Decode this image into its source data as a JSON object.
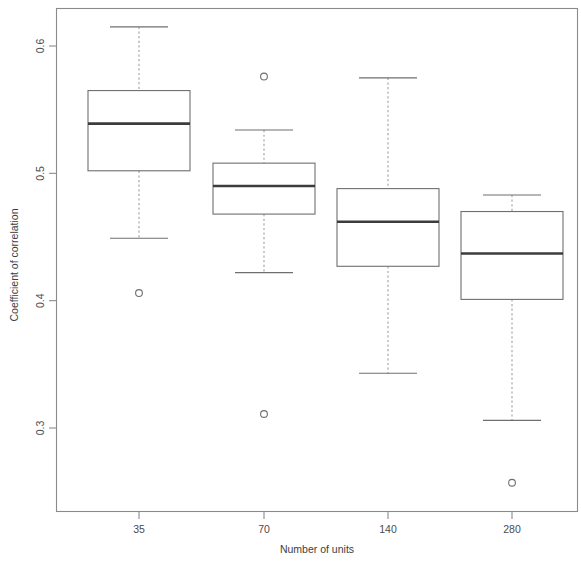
{
  "chart_data": {
    "type": "box",
    "title": "",
    "xlabel": "Number of units",
    "ylabel": "Coefficient of correlation",
    "categories": [
      "35",
      "70",
      "140",
      "280"
    ],
    "x_tick_labels": [
      "35",
      "70",
      "140",
      "280"
    ],
    "y_tick_labels": [
      "0.3",
      "0.4",
      "0.5",
      "0.6"
    ],
    "y_ticks": [
      0.3,
      0.4,
      0.5,
      0.6
    ],
    "ylim": [
      0.245,
      0.632
    ],
    "grid": false,
    "legend": "none",
    "boxes": [
      {
        "category": "35",
        "whisker_low": 0.449,
        "q1": 0.502,
        "median": 0.539,
        "q3": 0.565,
        "whisker_high": 0.615,
        "outliers": [
          0.406
        ]
      },
      {
        "category": "70",
        "whisker_low": 0.422,
        "q1": 0.468,
        "median": 0.49,
        "q3": 0.508,
        "whisker_high": 0.534,
        "outliers": [
          0.576,
          0.311
        ]
      },
      {
        "category": "140",
        "whisker_low": 0.343,
        "q1": 0.427,
        "median": 0.462,
        "q3": 0.488,
        "whisker_high": 0.575,
        "outliers": []
      },
      {
        "category": "280",
        "whisker_low": 0.306,
        "q1": 0.401,
        "median": 0.437,
        "q3": 0.47,
        "whisker_high": 0.483,
        "outliers": [
          0.257
        ]
      }
    ],
    "colors": {
      "frame": "#888a8c",
      "box_stroke": "#6d6f71",
      "median": "#3a3c3e",
      "whisker": "#9a9c9e",
      "text": "#4a4c4e",
      "background": "#ffffff"
    }
  }
}
